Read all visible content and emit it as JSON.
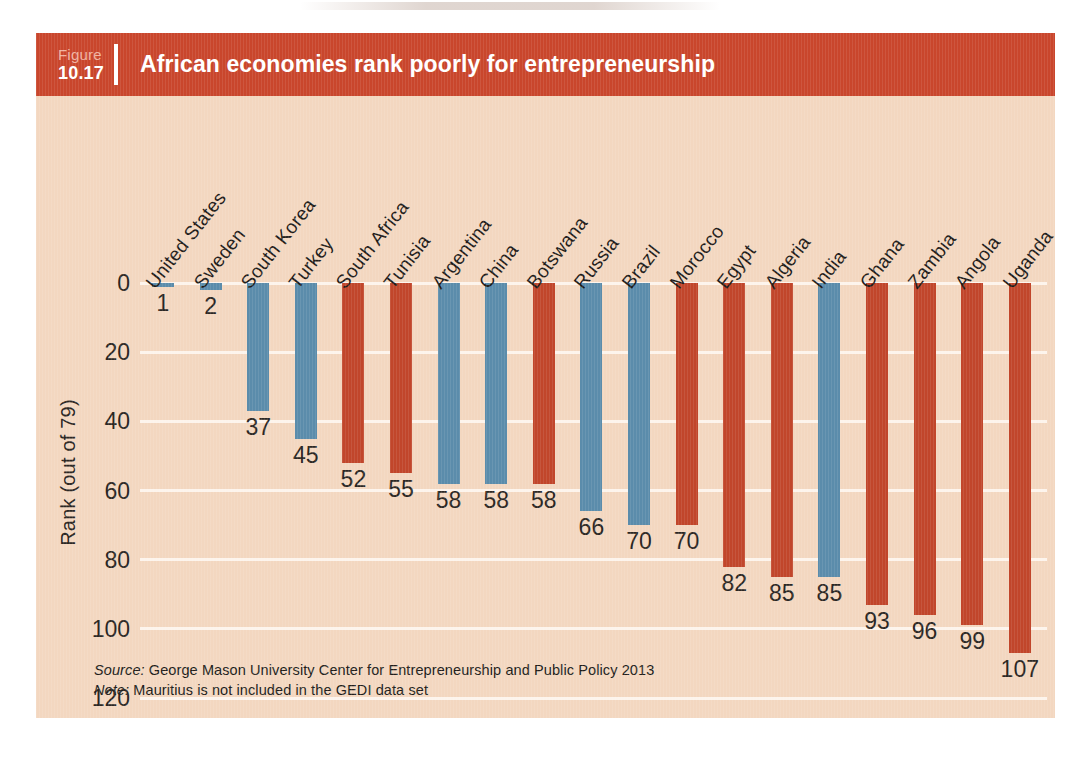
{
  "figure": {
    "label_word": "Figure",
    "number": "10.17",
    "title": "African economies rank poorly for entrepreneurship"
  },
  "footnotes": {
    "source_lead": "Source:",
    "source_text": " George Mason University Center for Entrepreneurship and Public Policy 2013",
    "note_lead": "Note:",
    "note_text": " Mauritius is not included in the GEDI data set"
  },
  "colors": {
    "header_band": "#c9462c",
    "panel_background": "#f3d7c0",
    "bar_blue": "#5b8cab",
    "bar_red": "#c1462b",
    "gridline": "#fdf4ec",
    "text": "#2b2724"
  },
  "chart_data": {
    "type": "bar",
    "title": "African economies rank poorly for entrepreneurship",
    "xlabel": "",
    "ylabel": "Rank (out of 79)",
    "ylim": [
      0,
      120
    ],
    "y_inverted": true,
    "grid": true,
    "legend_position": "none",
    "y_ticks": [
      0,
      20,
      40,
      60,
      80,
      100,
      120
    ],
    "categories": [
      "United States",
      "Sweden",
      "South Korea",
      "Turkey",
      "South Africa",
      "Tunisia",
      "Argentina",
      "China",
      "Botswana",
      "Russia",
      "Brazil",
      "Morocco",
      "Egypt",
      "Algeria",
      "India",
      "Ghana",
      "Zambia",
      "Angola",
      "Uganda"
    ],
    "values": [
      1,
      2,
      37,
      45,
      52,
      55,
      58,
      58,
      58,
      66,
      70,
      70,
      82,
      85,
      85,
      93,
      96,
      99,
      107
    ],
    "bar_colors": [
      "blue",
      "blue",
      "blue",
      "blue",
      "red",
      "red",
      "blue",
      "blue",
      "red",
      "blue",
      "blue",
      "red",
      "red",
      "red",
      "blue",
      "red",
      "red",
      "red",
      "red"
    ],
    "value_labels": [
      "1",
      "2",
      "37",
      "45",
      "52",
      "55",
      "58",
      "58",
      "58",
      "66",
      "70",
      "70",
      "82",
      "85",
      "85",
      "93",
      "96",
      "99",
      "107"
    ]
  }
}
